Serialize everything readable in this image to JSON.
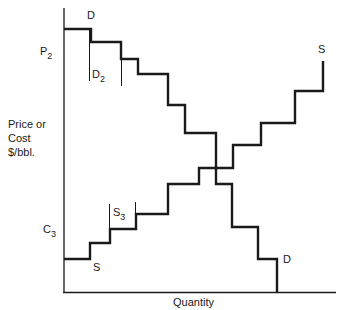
{
  "chart_data": {
    "type": "line",
    "title": "",
    "xlabel": "Quantity",
    "ylabel": "Price or Cost $/bbl.",
    "ylabel_lines": [
      "Price or",
      "Cost",
      "$/bbl."
    ],
    "grid": false,
    "legend": "none",
    "axis_ticks": {
      "y": [
        {
          "label": "P",
          "sub": "2",
          "position": "upper"
        },
        {
          "label": "C",
          "sub": "3",
          "position": "lower"
        }
      ]
    },
    "series": [
      {
        "name": "D",
        "role": "demand",
        "shape": "descending step function",
        "points": [
          [
            64,
            29
          ],
          [
            91,
            29
          ],
          [
            91,
            42
          ],
          [
            121,
            42
          ],
          [
            121,
            59
          ],
          [
            138,
            59
          ],
          [
            138,
            74
          ],
          [
            168,
            74
          ],
          [
            168,
            105
          ],
          [
            185,
            105
          ],
          [
            185,
            133
          ],
          [
            216,
            133
          ],
          [
            216,
            184
          ],
          [
            232,
            184
          ],
          [
            232,
            227
          ],
          [
            258,
            227
          ],
          [
            258,
            259
          ],
          [
            277,
            259
          ],
          [
            277,
            292
          ]
        ]
      },
      {
        "name": "S",
        "role": "supply",
        "shape": "ascending step function",
        "points": [
          [
            64,
            259
          ],
          [
            90,
            259
          ],
          [
            90,
            243
          ],
          [
            110,
            243
          ],
          [
            110,
            229
          ],
          [
            136,
            229
          ],
          [
            136,
            214
          ],
          [
            168,
            214
          ],
          [
            168,
            184
          ],
          [
            199,
            184
          ],
          [
            199,
            168
          ],
          [
            233,
            168
          ],
          [
            233,
            145
          ],
          [
            261,
            145
          ],
          [
            261,
            123
          ],
          [
            295,
            123
          ],
          [
            295,
            91
          ],
          [
            323,
            91
          ],
          [
            323,
            61
          ]
        ]
      }
    ],
    "annotations": [
      {
        "text": "D",
        "at": "top of demand curve"
      },
      {
        "text": "D",
        "at": "bottom of demand curve"
      },
      {
        "text": "S",
        "at": "bottom of supply curve"
      },
      {
        "text": "S",
        "at": "top of supply curve"
      },
      {
        "text": "D",
        "sub": "2",
        "at": "second demand step (bracketed)"
      },
      {
        "text": "S",
        "sub": "3",
        "at": "third supply step (bracketed)"
      }
    ]
  },
  "labels": {
    "p2": {
      "main": "P",
      "sub": "2"
    },
    "c3": {
      "main": "C",
      "sub": "3"
    },
    "d_top": "D",
    "d_bottom": "D",
    "s_bottom": "S",
    "s_top": "S",
    "d2": {
      "main": "D",
      "sub": "2"
    },
    "s3": {
      "main": "S",
      "sub": "3"
    },
    "ylabel_1": "Price or",
    "ylabel_2": "Cost",
    "ylabel_3": "$/bbl.",
    "xlabel": "Quantity"
  },
  "colors": {
    "ink": "#1a1a1a",
    "background": "#ffffff"
  }
}
